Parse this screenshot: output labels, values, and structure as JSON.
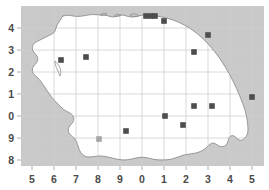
{
  "figure": {
    "title": "",
    "background_color": "#ffffff",
    "sea_color": "#c9c9c9",
    "land_color": "#ffffff",
    "grid_color": "#cfcfcf",
    "coastline_color": "#9a9a9a",
    "marker_color": "#4d4d4d",
    "marker_color_light": "#a6a6a6"
  },
  "axes": {
    "x_ticks": [
      {
        "label": "5",
        "px": 32
      },
      {
        "label": "6",
        "px": 54
      },
      {
        "label": "7",
        "px": 76
      },
      {
        "label": "8",
        "px": 98
      },
      {
        "label": "9",
        "px": 120
      },
      {
        "label": "0",
        "px": 142
      },
      {
        "label": "1",
        "px": 164
      },
      {
        "label": "2",
        "px": 186
      },
      {
        "label": "3",
        "px": 208
      },
      {
        "label": "4",
        "px": 230
      },
      {
        "label": "5",
        "px": 252
      }
    ],
    "y_ticks": [
      {
        "label": "4",
        "px": 28
      },
      {
        "label": "3",
        "px": 50
      },
      {
        "label": "2",
        "px": 72
      },
      {
        "label": "1",
        "px": 94
      },
      {
        "label": "0",
        "px": 116
      },
      {
        "label": "9",
        "px": 138
      },
      {
        "label": "8",
        "px": 160
      }
    ],
    "xlabel": "",
    "ylabel": "",
    "grid": true
  },
  "chart_data": {
    "type": "scatter",
    "title": "",
    "xlabel": "",
    "ylabel": "",
    "grid": true,
    "legend": null,
    "xlim": [
      4.5,
      5.4
    ],
    "ylim": [
      7.7,
      4.6
    ],
    "x_tick_labels": [
      "5",
      "6",
      "7",
      "8",
      "9",
      "0",
      "1",
      "2",
      "3",
      "4",
      "5"
    ],
    "y_tick_labels": [
      "4",
      "3",
      "2",
      "1",
      "0",
      "9",
      "8"
    ],
    "marker": "square",
    "series": [
      {
        "name": "stations",
        "color": "#4d4d4d",
        "points": [
          {
            "px": 146,
            "py": 16
          },
          {
            "px": 151,
            "py": 16
          },
          {
            "px": 155,
            "py": 16
          },
          {
            "px": 164,
            "py": 21
          },
          {
            "px": 208,
            "py": 35
          },
          {
            "px": 194,
            "py": 52
          },
          {
            "px": 61,
            "py": 60
          },
          {
            "px": 86,
            "py": 57
          },
          {
            "px": 252,
            "py": 97
          },
          {
            "px": 194,
            "py": 106
          },
          {
            "px": 212,
            "py": 106
          },
          {
            "px": 165,
            "py": 116
          },
          {
            "px": 183,
            "py": 125
          },
          {
            "px": 126,
            "py": 131
          }
        ]
      },
      {
        "name": "stations-light",
        "color": "#a6a6a6",
        "points": [
          {
            "px": 99,
            "py": 139
          }
        ]
      }
    ]
  },
  "icons": {
    "marker": "square-marker"
  }
}
